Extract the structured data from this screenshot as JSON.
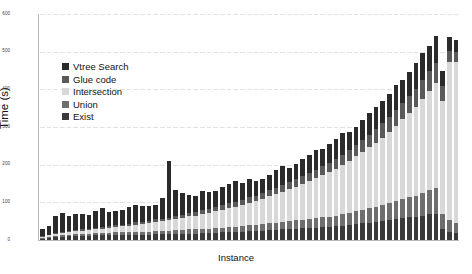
{
  "chart_data": {
    "type": "bar",
    "title": "Time profile SDD(r,a)+s",
    "xlabel": "Instance",
    "ylabel": "Time (s)",
    "ylim": [
      0,
      600
    ],
    "yticks": [
      0,
      100,
      200,
      300,
      400,
      500,
      600
    ],
    "grid": true,
    "stacked": true,
    "legend_position": "upper-left-inside",
    "xticklabels": [],
    "colors": {
      "Vtree Search": "#2b2b2b",
      "Glue code": "#5a5a5a",
      "Intersection": "#d8d8d8",
      "Union": "#6e6e6e",
      "Exist": "#3a3a3a"
    },
    "series": [
      {
        "name": "Exist",
        "values": [
          4,
          6,
          8,
          9,
          10,
          10,
          11,
          11,
          12,
          12,
          12,
          13,
          13,
          13,
          14,
          14,
          14,
          15,
          15,
          15,
          16,
          16,
          17,
          17,
          18,
          18,
          19,
          20,
          20,
          21,
          22,
          23,
          24,
          25,
          26,
          27,
          28,
          29,
          30,
          31,
          32,
          33,
          34,
          35,
          36,
          38,
          40,
          42,
          44,
          46,
          48,
          50,
          52,
          55,
          58,
          60,
          62,
          65,
          68,
          70,
          30,
          22,
          18
        ]
      },
      {
        "name": "Union",
        "values": [
          2,
          3,
          3,
          4,
          4,
          5,
          5,
          5,
          6,
          6,
          6,
          7,
          7,
          7,
          8,
          8,
          8,
          9,
          9,
          9,
          10,
          10,
          11,
          11,
          12,
          12,
          13,
          13,
          14,
          14,
          15,
          16,
          16,
          17,
          18,
          19,
          20,
          21,
          22,
          23,
          24,
          25,
          26,
          27,
          28,
          30,
          32,
          34,
          36,
          38,
          40,
          42,
          45,
          48,
          50,
          53,
          56,
          60,
          64,
          68,
          40,
          30,
          26
        ]
      },
      {
        "name": "Intersection",
        "values": [
          3,
          4,
          5,
          6,
          7,
          8,
          9,
          10,
          11,
          12,
          14,
          15,
          16,
          18,
          19,
          21,
          22,
          24,
          26,
          28,
          30,
          32,
          35,
          37,
          40,
          42,
          45,
          48,
          51,
          54,
          57,
          60,
          64,
          68,
          72,
          76,
          80,
          85,
          90,
          95,
          100,
          106,
          112,
          118,
          124,
          130,
          138,
          146,
          154,
          162,
          170,
          180,
          190,
          200,
          212,
          224,
          236,
          250,
          264,
          278,
          300,
          420,
          430
        ]
      },
      {
        "name": "Glue code",
        "values": [
          1,
          1,
          2,
          2,
          2,
          3,
          3,
          3,
          4,
          4,
          4,
          5,
          5,
          5,
          6,
          6,
          6,
          7,
          7,
          7,
          8,
          8,
          9,
          9,
          10,
          10,
          11,
          11,
          12,
          12,
          13,
          14,
          14,
          15,
          16,
          17,
          18,
          19,
          20,
          21,
          22,
          23,
          24,
          25,
          26,
          27,
          28,
          30,
          32,
          34,
          36,
          38,
          40,
          42,
          44,
          46,
          48,
          50,
          52,
          55,
          38,
          30,
          26
        ]
      },
      {
        "name": "Vtree Search",
        "values": [
          20,
          22,
          46,
          52,
          40,
          42,
          40,
          38,
          44,
          50,
          38,
          36,
          40,
          44,
          46,
          42,
          40,
          38,
          55,
          150,
          70,
          60,
          48,
          44,
          50,
          46,
          42,
          48,
          52,
          56,
          44,
          48,
          40,
          38,
          42,
          46,
          50,
          38,
          40,
          44,
          48,
          52,
          46,
          50,
          54,
          58,
          50,
          48,
          52,
          56,
          60,
          58,
          62,
          66,
          60,
          64,
          68,
          72,
          66,
          70,
          40,
          36,
          30
        ]
      }
    ]
  },
  "legend": {
    "items": [
      {
        "label": "Vtree Search",
        "color": "#2b2b2b"
      },
      {
        "label": "Glue code",
        "color": "#5a5a5a"
      },
      {
        "label": "Intersection",
        "color": "#d8d8d8"
      },
      {
        "label": "Union",
        "color": "#6e6e6e"
      },
      {
        "label": "Exist",
        "color": "#3a3a3a"
      }
    ]
  }
}
